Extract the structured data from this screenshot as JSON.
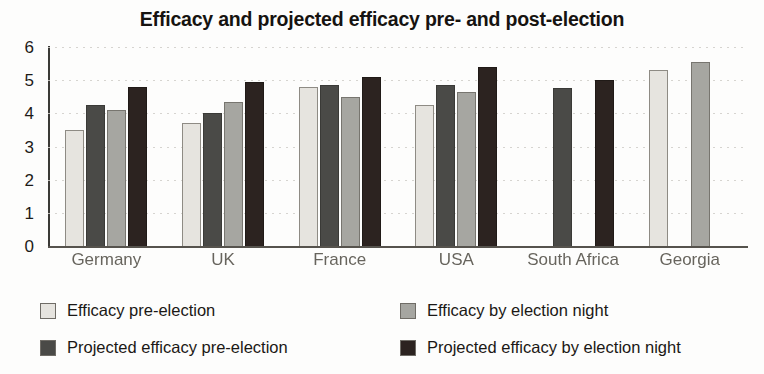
{
  "chart_data": {
    "type": "bar",
    "title": "Efficacy and projected efficacy pre- and post-election",
    "xlabel": "",
    "ylabel": "",
    "ylim": [
      0,
      6
    ],
    "yticks": [
      6,
      5,
      4,
      3,
      2,
      1,
      0
    ],
    "grid": true,
    "legend_position": "bottom",
    "categories": [
      "Germany",
      "UK",
      "France",
      "USA",
      "South Africa",
      "Georgia"
    ],
    "series": [
      {
        "name": "Efficacy pre-election",
        "color": "#e6e4df",
        "values": [
          3.5,
          3.7,
          4.8,
          4.25,
          null,
          5.3
        ]
      },
      {
        "name": "Projected efficacy pre-election",
        "color": "#4a4a47",
        "values": [
          4.25,
          4.0,
          4.85,
          4.85,
          4.75,
          null
        ]
      },
      {
        "name": "Efficacy by election night",
        "color": "#a6a6a1",
        "values": [
          4.1,
          4.35,
          4.5,
          4.65,
          null,
          5.55
        ]
      },
      {
        "name": "Projected efficacy by election night",
        "color": "#2c2320",
        "values": [
          4.8,
          4.95,
          5.1,
          5.4,
          5.0,
          null
        ]
      }
    ],
    "legend": [
      {
        "label": "Efficacy pre-election",
        "color": "#e6e4df"
      },
      {
        "label": "Efficacy by election night",
        "color": "#a6a6a1"
      },
      {
        "label": "Projected efficacy pre-election",
        "color": "#4a4a47"
      },
      {
        "label": "Projected efficacy by election night",
        "color": "#2c2320"
      }
    ]
  }
}
